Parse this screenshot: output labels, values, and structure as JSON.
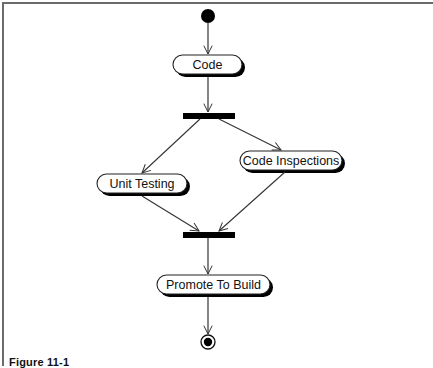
{
  "diagram": {
    "type": "UML activity diagram",
    "start_node": {
      "id": "start",
      "label": "initial-node"
    },
    "activities": [
      {
        "id": "code",
        "label": "Code"
      },
      {
        "id": "unit_testing",
        "label": "Unit Testing"
      },
      {
        "id": "code_inspections",
        "label": "Code Inspections"
      },
      {
        "id": "promote",
        "label": "Promote To Build"
      }
    ],
    "bars": [
      {
        "id": "fork",
        "kind": "fork"
      },
      {
        "id": "join",
        "kind": "join"
      }
    ],
    "end_node": {
      "id": "end",
      "label": "final-node"
    },
    "edges": [
      {
        "from": "start",
        "to": "code"
      },
      {
        "from": "code",
        "to": "fork"
      },
      {
        "from": "fork",
        "to": "unit_testing"
      },
      {
        "from": "fork",
        "to": "code_inspections"
      },
      {
        "from": "unit_testing",
        "to": "join"
      },
      {
        "from": "code_inspections",
        "to": "join"
      },
      {
        "from": "join",
        "to": "promote"
      },
      {
        "from": "promote",
        "to": "end"
      }
    ]
  },
  "caption": {
    "text": "Figure 11-1"
  },
  "colors": {
    "line": "#333333",
    "fill": "#ffffff",
    "bar": "#000000",
    "frame": "#6b6b6b"
  }
}
